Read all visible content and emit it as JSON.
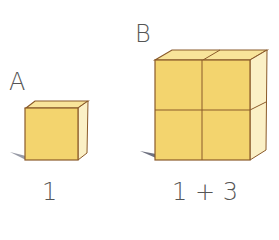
{
  "figures": [
    {
      "letter": "A",
      "caption": "1",
      "grid": 1
    },
    {
      "letter": "B",
      "caption": "1 + 3",
      "grid": 2
    }
  ],
  "colors": {
    "front": "#f3d46e",
    "top": "#f8e49a",
    "side": "#fbf0c6",
    "edge": "#8a5a2a",
    "shadow": "#6b6f80",
    "text": "#555555"
  }
}
